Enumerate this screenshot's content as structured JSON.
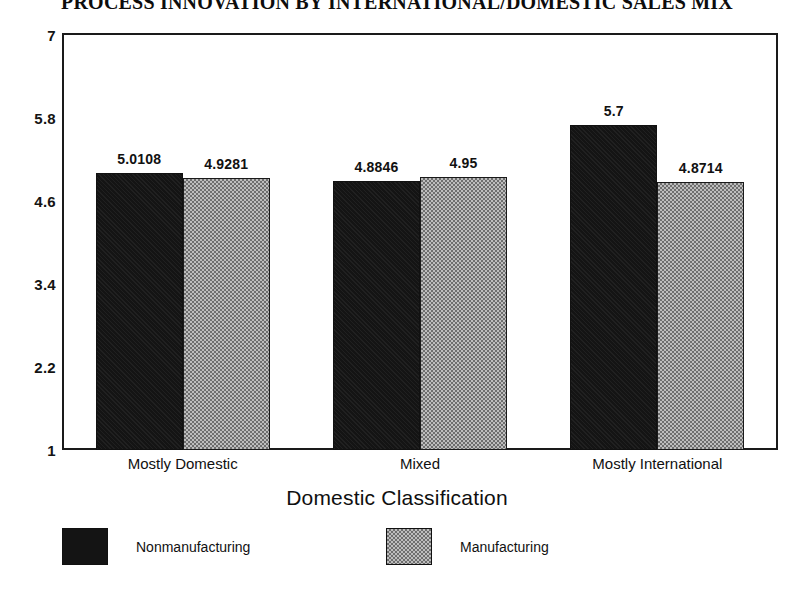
{
  "chart_data": {
    "type": "bar",
    "title": "PROCESS INNOVATION BY INTERNATIONAL/DOMESTIC SALES MIX",
    "xlabel": "Domestic Classification",
    "ylabel": "",
    "categories": [
      "Mostly Domestic",
      "Mixed",
      "Mostly International"
    ],
    "series": [
      {
        "name": "Nonmanufacturing",
        "color": "#141414",
        "values": [
          5.0108,
          4.8846,
          5.7
        ],
        "labels": [
          "5.0108",
          "4.8846",
          "5.7"
        ]
      },
      {
        "name": "Manufacturing",
        "color": "#8a8a8a",
        "values": [
          4.9281,
          4.95,
          4.8714
        ],
        "labels": [
          "4.9281",
          "4.95",
          "4.8714"
        ]
      }
    ],
    "ylim": [
      1,
      7
    ],
    "yticks": [
      7,
      5.8,
      4.6,
      3.4,
      2.2,
      1
    ],
    "ytick_labels": [
      "7",
      "5.8",
      "4.6",
      "3.4",
      "2.2",
      "1"
    ],
    "grid": false,
    "legend_position": "bottom"
  },
  "legend": {
    "items": [
      {
        "label": "Nonmanufacturing"
      },
      {
        "label": "Manufacturing"
      }
    ]
  }
}
